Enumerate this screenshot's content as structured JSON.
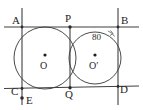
{
  "figure": {
    "background_color": "#ffffff",
    "stroke_color": "#3a3a3a",
    "width": 143,
    "height": 110
  },
  "points": [
    {
      "id": "A",
      "label": "A",
      "x": 22,
      "y": 27,
      "label_x": 12,
      "label_y": 15
    },
    {
      "id": "P",
      "label": "P",
      "x": 70,
      "y": 27,
      "label_x": 66,
      "label_y": 14
    },
    {
      "id": "B",
      "label": "B",
      "x": 118,
      "y": 27,
      "label_x": 121,
      "label_y": 15
    },
    {
      "id": "C",
      "label": "C",
      "x": 22,
      "y": 88,
      "label_x": 12,
      "label_y": 86
    },
    {
      "id": "Q",
      "label": "Q",
      "x": 70,
      "y": 89,
      "label_x": 66,
      "label_y": 90
    },
    {
      "id": "D",
      "label": "D",
      "x": 118,
      "y": 87,
      "label_x": 120,
      "label_y": 85
    },
    {
      "id": "E",
      "label": "E",
      "x": 22,
      "y": 100,
      "label_x": 26,
      "label_y": 95
    }
  ],
  "centers": [
    {
      "id": "O",
      "label": "O",
      "prime": "",
      "x": 45,
      "y": 58,
      "label_x": 40,
      "label_y": 62,
      "radius": 31
    },
    {
      "id": "Op",
      "label": "O",
      "prime": "′",
      "x": 95,
      "y": 58,
      "label_x": 90,
      "label_y": 62,
      "radius": 26
    }
  ],
  "angle": {
    "value": "80",
    "degree_symbol": "°",
    "label": "80",
    "label_x": 93,
    "label_y": 34,
    "vertex": "B"
  },
  "lines": [
    {
      "id": "APB",
      "name": "top-secant-line",
      "x1": 4,
      "y1": 27,
      "x2": 139,
      "y2": 27
    },
    {
      "id": "CQD",
      "name": "bottom-secant-line",
      "x1": 4,
      "y1": 88.5,
      "x2": 139,
      "y2": 86
    },
    {
      "id": "ACE",
      "name": "left-vertical-line",
      "x1": 22,
      "y1": 8,
      "x2": 22,
      "y2": 105
    },
    {
      "id": "BD",
      "name": "right-vertical-line",
      "x1": 118,
      "y1": 8,
      "x2": 118,
      "y2": 105
    },
    {
      "id": "PQ",
      "name": "common-chord",
      "x1": 70,
      "y1": 27,
      "x2": 70,
      "y2": 89
    }
  ],
  "markers": [
    {
      "id": "E-dot",
      "name": "point-marker-e",
      "x": 22,
      "y": 98
    }
  ]
}
